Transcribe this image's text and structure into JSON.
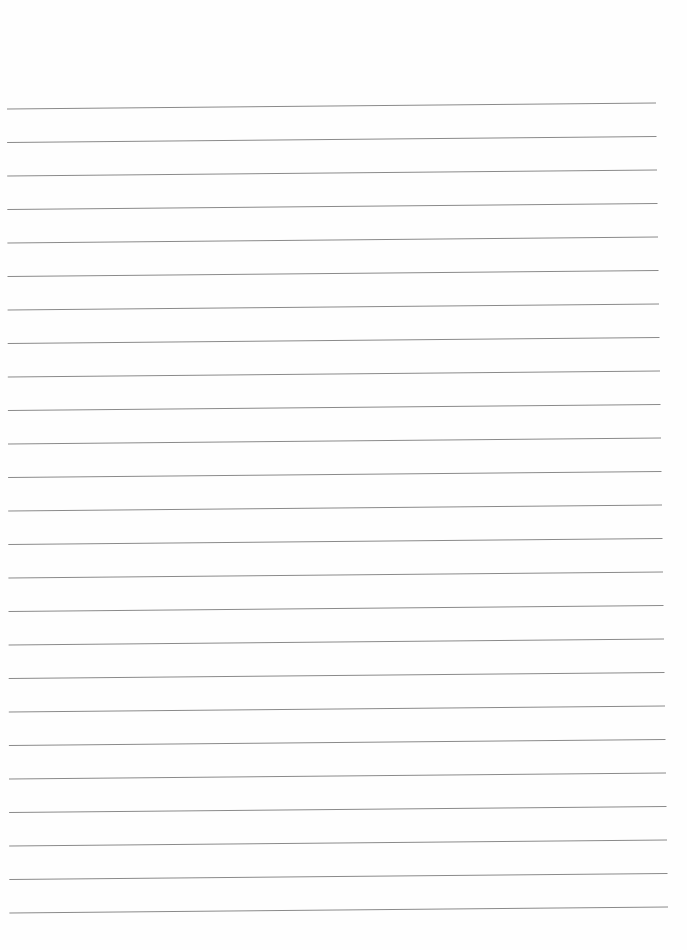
{
  "page": {
    "type": "lined-paper",
    "background_color": "#fefefe",
    "line_color": "#8a8a8a",
    "line_count": 25,
    "lines": {
      "first_left_y": 109,
      "first_right_y": 103,
      "spacing": 33.5,
      "left_x": 7,
      "right_x_top": 656,
      "right_x_bottom": 668
    }
  }
}
